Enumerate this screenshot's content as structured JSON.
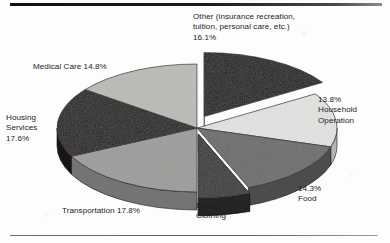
{
  "figure": {
    "background_color": "#fdfdfd",
    "top_rule_color": "#1b1b1b",
    "bottom_rule_color": "#6f6f6f"
  },
  "chart_data": {
    "type": "pie",
    "title": "",
    "subtitle": "",
    "xlabel": "",
    "ylabel": "",
    "legend_position": "none",
    "grid": false,
    "three_d": true,
    "start_angle_deg": 0,
    "direction": "clockwise",
    "center": {
      "x": 197,
      "y": 128
    },
    "radius_x": 140,
    "radius_y": 64,
    "depth": 18,
    "value_suffix": "%",
    "categories": [
      "Other (insurance recreation, tuition, personal care, etc.)",
      "Household Operation",
      "Food",
      "Clothing",
      "Transportation",
      "Housing Services",
      "Medical Care"
    ],
    "values": [
      16.1,
      13.8,
      14.3,
      6.0,
      17.8,
      17.6,
      14.8
    ],
    "slice_colors": [
      "#211d1c",
      "#e2e2e0",
      "#6d6b6a",
      "#3a3837",
      "#9d9c9a",
      "#241f1e",
      "#bbbab7"
    ],
    "exploded": [
      true,
      false,
      false,
      true,
      false,
      false,
      false
    ],
    "slices": [
      {
        "name": "other",
        "label": "Other (insurance recreation,\ntuition, personal care, etc.)\n16.1%",
        "value": 16.1,
        "color": "#211d1c",
        "side_color": "#171313",
        "exploded": true,
        "explode_offset": 15
      },
      {
        "name": "household",
        "label": "13.8%\nHousehold\nOperation",
        "value": 13.8,
        "color": "#e2e2e0",
        "side_color": "#b6b5b2",
        "exploded": false,
        "explode_offset": 0
      },
      {
        "name": "food",
        "label": "14.3%\nFood",
        "value": 14.3,
        "color": "#6d6b6a",
        "side_color": "#4e4c4b",
        "exploded": false,
        "explode_offset": 0
      },
      {
        "name": "clothing",
        "label": "6.0%\nClothing",
        "value": 6.0,
        "color": "#3a3837",
        "side_color": "#272524",
        "exploded": true,
        "explode_offset": 7
      },
      {
        "name": "transportation",
        "label": "Transportation 17.8%",
        "value": 17.8,
        "color": "#9d9c9a",
        "side_color": "#757472",
        "exploded": false,
        "explode_offset": 0
      },
      {
        "name": "housing",
        "label": "Housing\nServices\n17.6%",
        "value": 17.6,
        "color": "#241f1e",
        "side_color": "#191514",
        "exploded": false,
        "explode_offset": 0
      },
      {
        "name": "medical",
        "label": "Medical Care 14.8%",
        "value": 14.8,
        "color": "#bbbab7",
        "side_color": "#90908d",
        "exploded": false,
        "explode_offset": 0
      }
    ]
  },
  "labels": {
    "other": "Other (insurance recreation,\ntuition, personal care, etc.)\n16.1%",
    "household": "13.8%\nHousehold\nOperation",
    "food": "14.3%\nFood",
    "clothing": "6.0%\nClothing",
    "transportation": "Transportation 17.8%",
    "housing": "Housing\nServices\n17.6%",
    "medical": "Medical Care 14.8%"
  }
}
